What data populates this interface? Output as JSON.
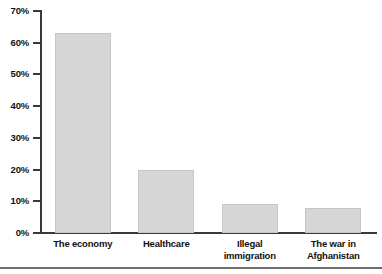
{
  "chart_data": {
    "type": "bar",
    "title": "",
    "subtitle": "",
    "xlabel": "",
    "ylabel": "",
    "categories": [
      "The economy",
      "Healthcare",
      "Illegal immigration",
      "The war in Afghanistan"
    ],
    "category_lines": [
      [
        "The economy"
      ],
      [
        "Healthcare"
      ],
      [
        "Illegal",
        "immigration"
      ],
      [
        "The war in",
        "Afghanistan"
      ]
    ],
    "values": [
      63,
      20,
      9,
      8
    ],
    "ylim": [
      0,
      70
    ],
    "ytick_values": [
      0,
      10,
      20,
      30,
      40,
      50,
      60,
      70
    ],
    "ytick_labels": [
      "0%",
      "10%",
      "20%",
      "30%",
      "40%",
      "50%",
      "60%",
      "70%"
    ],
    "grid": false,
    "legend": null,
    "legend_position": "none",
    "bar_color": "#d6d6d6",
    "bar_edge_color": "#c6c6c6",
    "axis_color": "#3a3a3a",
    "text_color": "#111111",
    "background_color": "#ffffff"
  }
}
